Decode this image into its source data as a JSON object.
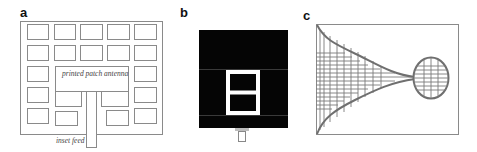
{
  "panels": [
    {
      "label": "a",
      "title": "Printed patch antenna with inset feed on periodic ground",
      "annotations": {
        "patch_label": "printed patch antenna",
        "feed_label": "inset feed"
      }
    },
    {
      "label": "b",
      "title": "Patch with slot on dark substrate"
    },
    {
      "label": "c",
      "title": "Tapered mesh antenna with circular element"
    }
  ],
  "colors": {
    "line": "#888888",
    "dark_fill": "#050505",
    "mesh": "#7a7a7a",
    "background": "#ffffff"
  }
}
